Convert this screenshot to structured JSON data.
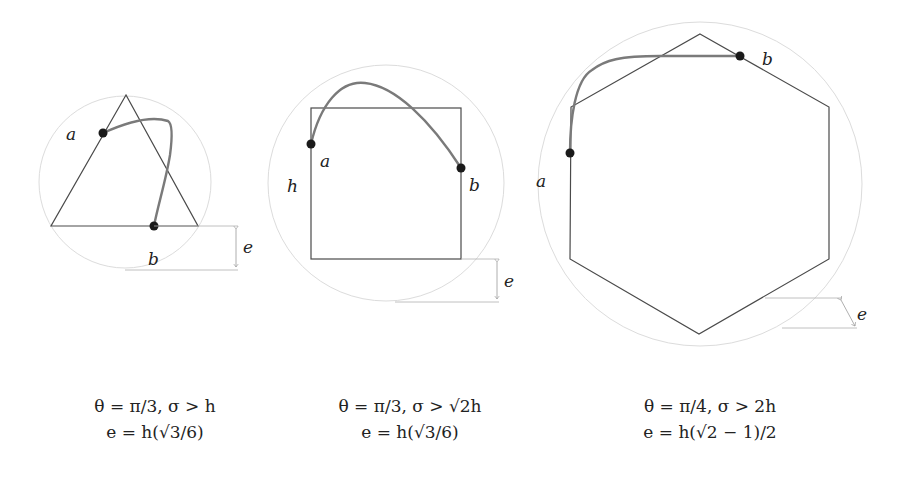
{
  "colors": {
    "shape_stroke": "#4a4a4a",
    "curve_stroke": "#7a7a7a",
    "circle_stroke": "#d8d8d8",
    "dimension_stroke": "#9a9a9a",
    "point_fill": "#1a1a1a",
    "text": "#222222"
  },
  "panels": [
    {
      "shape": "triangle",
      "labels": {
        "a": "a",
        "b": "b",
        "e": "e"
      },
      "caption": {
        "line1": "θ = π/3, σ > h",
        "line2": "e = h(√3/6)"
      }
    },
    {
      "shape": "square",
      "labels": {
        "a": "a",
        "b": "b",
        "h": "h",
        "e": "e"
      },
      "caption": {
        "line1": "θ = π/3, σ > √2h",
        "line2": "e = h(√3/6)"
      }
    },
    {
      "shape": "hexagon",
      "labels": {
        "a": "a",
        "b": "b",
        "e": "e"
      },
      "caption": {
        "line1": "θ = π/4, σ > 2h",
        "line2": "e = h(√2 − 1)/2"
      }
    }
  ]
}
